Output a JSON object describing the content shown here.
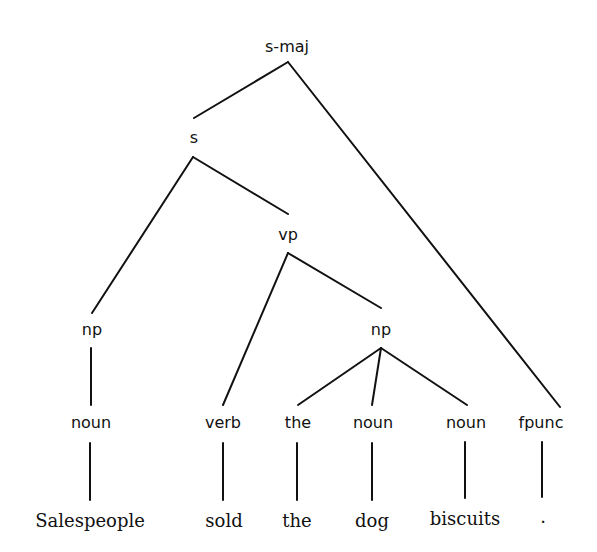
{
  "diagram": {
    "type": "parse-tree",
    "nodes": {
      "s_maj": "s-maj",
      "s": "s",
      "vp": "vp",
      "np_subject": "np",
      "np_object": "np",
      "noun_1": "noun",
      "verb": "verb",
      "det_the": "the",
      "noun_2": "noun",
      "noun_3": "noun",
      "fpunc": "fpunc"
    },
    "words": [
      "Salespeople",
      "sold",
      "the",
      "dog",
      "biscuits",
      "."
    ],
    "edges": [
      [
        "s-maj",
        "s"
      ],
      [
        "s-maj",
        "fpunc"
      ],
      [
        "s",
        "np"
      ],
      [
        "s",
        "vp"
      ],
      [
        "vp",
        "verb"
      ],
      [
        "vp",
        "np"
      ],
      [
        "np",
        "noun"
      ],
      [
        "np",
        "the"
      ],
      [
        "np",
        "noun"
      ],
      [
        "np",
        "noun"
      ],
      [
        "noun",
        "Salespeople"
      ],
      [
        "verb",
        "sold"
      ],
      [
        "the",
        "the"
      ],
      [
        "noun",
        "dog"
      ],
      [
        "noun",
        "biscuits"
      ],
      [
        "fpunc",
        "."
      ]
    ]
  }
}
